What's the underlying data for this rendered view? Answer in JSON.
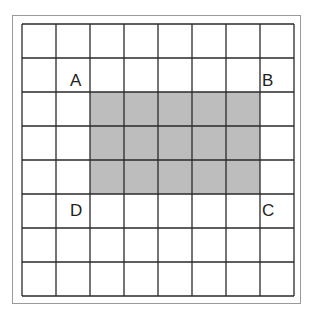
{
  "diagram": {
    "type": "grid",
    "columns": 8,
    "rows": 8,
    "cell_size": 34,
    "grid_line_color": "#2a2a2a",
    "background_color": "#ffffff",
    "shaded_region": {
      "col_start": 2,
      "col_end": 6,
      "row_start": 2,
      "row_end": 4,
      "fill_color": "#bdbdbd"
    },
    "labels": [
      {
        "text": "A",
        "x": 70,
        "y": 72
      },
      {
        "text": "B",
        "x": 262,
        "y": 72
      },
      {
        "text": "C",
        "x": 262,
        "y": 202
      },
      {
        "text": "D",
        "x": 70,
        "y": 202
      }
    ]
  }
}
